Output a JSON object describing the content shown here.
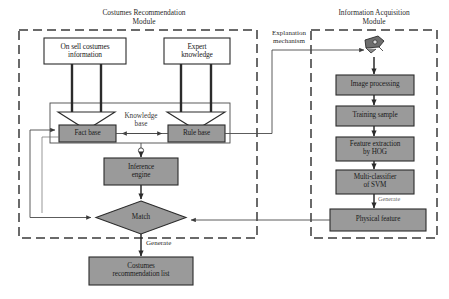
{
  "figure": {
    "type": "flowchart-diagram",
    "colors": {
      "grey_fill": "#9a9a9a",
      "white_fill": "#ffffff",
      "stroke": "#2b2b2b",
      "dashed_border": "#3a3a3a",
      "background": "#ffffff"
    }
  },
  "modules": [
    {
      "id": "costumes-recommendation-module",
      "title_line1": "Costumes Recommendation",
      "title_line2": "Module"
    },
    {
      "id": "information-acquisition-module",
      "title_line1": "Information Acquisition",
      "title_line2": "Module"
    }
  ],
  "nodes": {
    "on_sell_costumes": {
      "line1": "On sell costumes",
      "line2": "information"
    },
    "expert_knowledge": {
      "line1": "Expert",
      "line2": "knowledge"
    },
    "fact_base": {
      "line1": "Fact base"
    },
    "rule_base": {
      "line1": "Rule base"
    },
    "knowledge_base": {
      "line1": "Knowledge",
      "line2": "base"
    },
    "inference_engine": {
      "line1": "Inference",
      "line2": "engine"
    },
    "match": {
      "line1": "Match"
    },
    "costumes_recommendation_list": {
      "line1": "Costumes",
      "line2": "recommendation list"
    },
    "image_processing": {
      "line1": "Image processing"
    },
    "training_sample": {
      "line1": "Training sample"
    },
    "feature_extraction": {
      "line1": "Feature extraction",
      "line2": "by HOG"
    },
    "multi_classifier": {
      "line1": "Multi-classifier",
      "line2": "of SVM"
    },
    "physical_feature": {
      "line1": "Physical feature"
    }
  },
  "edge_labels": {
    "explanation_mechanism_line1": "Explanation",
    "explanation_mechanism_line2": "mechanism",
    "generate_bottom": "Generate",
    "generate_right": "Generate"
  },
  "icons": {
    "camera": "camera-icon"
  }
}
